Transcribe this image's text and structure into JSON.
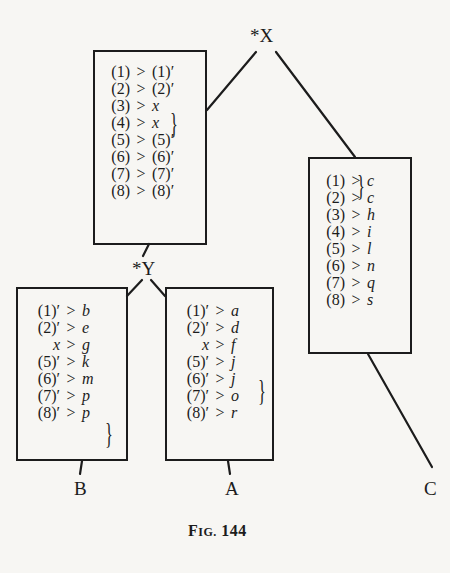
{
  "figure": {
    "caption_prefix": "F",
    "caption_smallcaps": "IG.",
    "caption_number": "144"
  },
  "nodes": {
    "X": {
      "label": "*X"
    },
    "Y": {
      "label": "*Y"
    },
    "A": {
      "label": "A"
    },
    "B": {
      "label": "B"
    },
    "C": {
      "label": "C"
    }
  },
  "boxes": {
    "top": {
      "rows": [
        {
          "lhs": "(1)",
          "op": ">",
          "rhs": "(1)′",
          "rhs_italic": false
        },
        {
          "lhs": "(2)",
          "op": ">",
          "rhs": "(2)′",
          "rhs_italic": false
        },
        {
          "lhs": "(3)",
          "op": ">",
          "rhs": "x",
          "rhs_italic": true
        },
        {
          "lhs": "(4)",
          "op": ">",
          "rhs": "x",
          "rhs_italic": true
        },
        {
          "lhs": "(5)",
          "op": ">",
          "rhs": "(5)′",
          "rhs_italic": false
        },
        {
          "lhs": "(6)",
          "op": ">",
          "rhs": "(6)′",
          "rhs_italic": false
        },
        {
          "lhs": "(7)",
          "op": ">",
          "rhs": "(7)′",
          "rhs_italic": false
        },
        {
          "lhs": "(8)",
          "op": ">",
          "rhs": "(8)′",
          "rhs_italic": false
        }
      ],
      "brace": "}"
    },
    "B": {
      "rows": [
        {
          "lhs": "(1)′",
          "op": ">",
          "rhs": "b"
        },
        {
          "lhs": "(2)′",
          "op": ">",
          "rhs": "e"
        },
        {
          "lhs": "x",
          "op": ">",
          "rhs": "g"
        },
        {
          "lhs": "(5)′",
          "op": ">",
          "rhs": "k"
        },
        {
          "lhs": "(6)′",
          "op": ">",
          "rhs": "m"
        },
        {
          "lhs": "(7)′",
          "op": ">",
          "rhs": "p"
        },
        {
          "lhs": "(8)′",
          "op": ">",
          "rhs": "p"
        }
      ],
      "brace": "}"
    },
    "A": {
      "rows": [
        {
          "lhs": "(1)′",
          "op": ">",
          "rhs": "a"
        },
        {
          "lhs": "(2)′",
          "op": ">",
          "rhs": "d"
        },
        {
          "lhs": "x",
          "op": ">",
          "rhs": "f"
        },
        {
          "lhs": "(5)′",
          "op": ">",
          "rhs": "j"
        },
        {
          "lhs": "(6)′",
          "op": ">",
          "rhs": "j"
        },
        {
          "lhs": "(7)′",
          "op": ">",
          "rhs": "o"
        },
        {
          "lhs": "(8)′",
          "op": ">",
          "rhs": "r"
        }
      ],
      "brace": "}"
    },
    "C": {
      "rows": [
        {
          "lhs": "(1)",
          "op": ">",
          "rhs": "c"
        },
        {
          "lhs": "(2)",
          "op": ">",
          "rhs": "c"
        },
        {
          "lhs": "(3)",
          "op": ">",
          "rhs": "h"
        },
        {
          "lhs": "(4)",
          "op": ">",
          "rhs": "i"
        },
        {
          "lhs": "(5)",
          "op": ">",
          "rhs": "l"
        },
        {
          "lhs": "(6)",
          "op": ">",
          "rhs": "n"
        },
        {
          "lhs": "(7)",
          "op": ">",
          "rhs": "q"
        },
        {
          "lhs": "(8)",
          "op": ">",
          "rhs": "s"
        }
      ],
      "brace": "}"
    }
  },
  "colors": {
    "ink": "#1c1c1c",
    "paper": "#f7f6f3"
  }
}
